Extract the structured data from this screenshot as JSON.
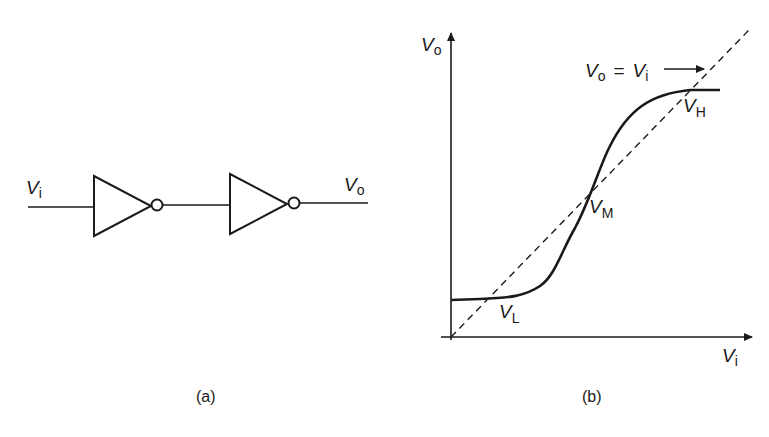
{
  "panel_a": {
    "caption": "(a)",
    "input_label": {
      "main": "V",
      "sub": "i"
    },
    "output_label": {
      "main": "V",
      "sub": "o"
    },
    "components": [
      "inverter-1",
      "inverter-2"
    ]
  },
  "panel_b": {
    "caption": "(b)",
    "y_axis_label": {
      "main": "V",
      "sub": "o"
    },
    "x_axis_label": {
      "main": "V",
      "sub": "i"
    },
    "line_label": {
      "a_main": "V",
      "a_sub": "o",
      "eq": "=",
      "b_main": "V",
      "b_sub": "i"
    },
    "points": {
      "VH": {
        "main": "V",
        "sub": "H"
      },
      "VM": {
        "main": "V",
        "sub": "M"
      },
      "VL": {
        "main": "V",
        "sub": "L"
      }
    }
  },
  "colors": {
    "ink": "#1a1a1a",
    "background": "#ffffff"
  }
}
